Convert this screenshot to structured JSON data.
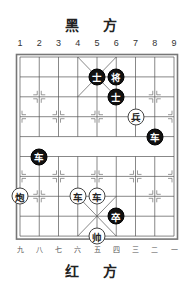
{
  "top_label": "黑 方",
  "bottom_label": "红 方",
  "top_numbers": [
    "1",
    "2",
    "3",
    "4",
    "5",
    "6",
    "7",
    "8",
    "9"
  ],
  "bottom_numbers": [
    "九",
    "八",
    "七",
    "六",
    "五",
    "四",
    "三",
    "二",
    "一"
  ],
  "board": {
    "columns": 9,
    "rows": 10,
    "grid_left": 20,
    "grid_top": 57,
    "col_spacing": 19.25,
    "row_spacing": 19.9
  },
  "pieces": [
    {
      "side": "black",
      "char": "士",
      "name": "black-advisor",
      "col": 5,
      "row": 1
    },
    {
      "side": "black",
      "char": "将",
      "name": "black-general",
      "col": 6,
      "row": 1
    },
    {
      "side": "black",
      "char": "士",
      "name": "black-advisor",
      "col": 6,
      "row": 2
    },
    {
      "side": "red",
      "char": "兵",
      "name": "red-soldier",
      "col": 7,
      "row": 3
    },
    {
      "side": "black",
      "char": "车",
      "name": "black-chariot",
      "col": 8,
      "row": 4
    },
    {
      "side": "black",
      "char": "车",
      "name": "black-chariot",
      "col": 2,
      "row": 5
    },
    {
      "side": "red",
      "char": "炮",
      "name": "red-cannon",
      "col": 1,
      "row": 7
    },
    {
      "side": "red",
      "char": "车",
      "name": "red-chariot",
      "col": 4,
      "row": 7
    },
    {
      "side": "red",
      "char": "车",
      "name": "red-chariot",
      "col": 5,
      "row": 7
    },
    {
      "side": "black",
      "char": "卒",
      "name": "black-soldier",
      "col": 6,
      "row": 8
    },
    {
      "side": "red",
      "char": "帅",
      "name": "red-general",
      "col": 5,
      "row": 9
    }
  ]
}
